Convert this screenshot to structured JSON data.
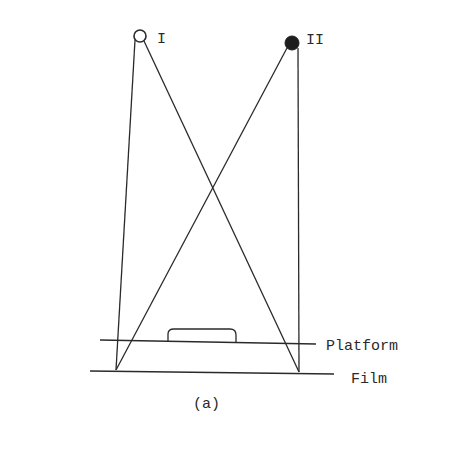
{
  "diagram": {
    "caption": "(a)",
    "sources": [
      {
        "label": "I",
        "style": "open",
        "cx": 140,
        "cy": 36,
        "r": 6
      },
      {
        "label": "II",
        "style": "filled",
        "cx": 292,
        "cy": 43,
        "r": 7
      }
    ],
    "labels": {
      "platform": "Platform",
      "film": "Film"
    },
    "colors": {
      "line": "#2a2a2a",
      "background": "#ffffff"
    }
  }
}
